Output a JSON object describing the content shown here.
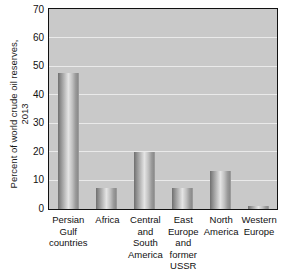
{
  "chart_data": {
    "type": "bar",
    "title": "",
    "xlabel": "",
    "ylabel": "Percent of world crude oil reserves, 2013",
    "ylabel_lines": [
      "Percent of world crude oil reserves,",
      "2013"
    ],
    "categories": [
      "Persian Gulf countries",
      "Africa",
      "Central and South America",
      "East Europe and former USSR",
      "North America",
      "Western Europe"
    ],
    "category_label_lines": [
      [
        "Persian",
        "Gulf",
        "countries"
      ],
      [
        "Africa"
      ],
      [
        "Central",
        "and",
        "South",
        "America"
      ],
      [
        "East",
        "Europe",
        "and",
        "former",
        "USSR"
      ],
      [
        "North",
        "America"
      ],
      [
        "Western",
        "Europe"
      ]
    ],
    "values": [
      48,
      7.5,
      20,
      7.5,
      13.5,
      1
    ],
    "ylim": [
      0,
      70
    ],
    "ytick_values": [
      0,
      10,
      20,
      30,
      40,
      50,
      60,
      70
    ],
    "ytick_labels": [
      "0",
      "10",
      "20",
      "30",
      "40",
      "50",
      "60",
      "70"
    ],
    "grid": true,
    "grid_axis": "y",
    "legend": false,
    "legend_position": "none",
    "plot_background_color": "#c9c9c9",
    "gridline_color": "#eaeaea",
    "bar_color": "#b0b0b0",
    "axis_color": "#111111",
    "figure_background_color": "#ffffff"
  }
}
